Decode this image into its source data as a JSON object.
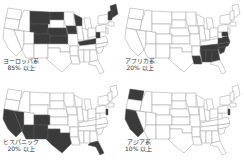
{
  "figure": {
    "panels": [
      {
        "id": "european",
        "line1": "ヨーロッパ系",
        "line2": "85% 以上",
        "highlighted_states": [
          "MT",
          "WY",
          "ND",
          "NE",
          "KS",
          "IA",
          "WI",
          "KY",
          "WV",
          "ME",
          "NH",
          "VT",
          "CO",
          "IN-part"
        ]
      },
      {
        "id": "african",
        "line1": "アフリカ系",
        "line2": "20% 以上",
        "highlighted_states": [
          "LA",
          "MS",
          "AL",
          "GA",
          "SC",
          "NC",
          "TN",
          "VA",
          "MD",
          "DE"
        ]
      },
      {
        "id": "hispanic",
        "line1": "ヒスパニック",
        "line2": "20% 以上",
        "highlighted_states": [
          "CA",
          "NV",
          "AZ",
          "NM",
          "TX",
          "CO",
          "FL",
          "NJ"
        ]
      },
      {
        "id": "asian",
        "line1": "アジア系",
        "line2": "10% 以上",
        "highlighted_states": [
          "WA",
          "CA",
          "NJ"
        ]
      }
    ],
    "colors": {
      "highlight": "#3b3b3b",
      "outline": "#9a9a9a",
      "background": "#ffffff"
    }
  }
}
